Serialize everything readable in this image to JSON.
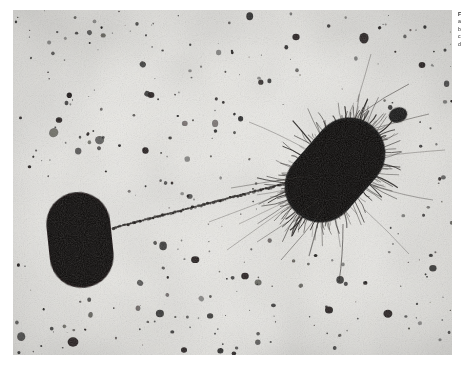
{
  "figure": {
    "kind": "electron-micrograph",
    "plate": {
      "background_color": "#e9e8e4",
      "stain": "negative stain",
      "border_color": "#ffffff"
    },
    "margin_caption": {
      "visible_fragment": "clipped at page edge",
      "lines": [
        "F",
        "a",
        "b",
        "c",
        "d"
      ]
    },
    "structures": [
      {
        "id": "recipient-cell",
        "label": "smooth rod-shaped cell",
        "shape": "capsule",
        "fill": "#120f0e",
        "cx": 67,
        "cy": 230,
        "rx": 32,
        "ry": 48,
        "rotation": -6
      },
      {
        "id": "donor-cell",
        "label": "fimbriated cell bearing numerous pili",
        "shape": "capsule",
        "fill": "#100d0c",
        "cx": 322,
        "cy": 160,
        "rx": 36,
        "ry": 58,
        "rotation": 41,
        "fimbriae_count": 150
      },
      {
        "id": "f-pilus",
        "label": "conjugative F pilus labelled with particles",
        "shape": "beaded-filament",
        "x1": 100,
        "y1": 218,
        "x2": 295,
        "y2": 168,
        "bead_count": 78
      },
      {
        "id": "polar-blob",
        "label": "dense particle at cell pole",
        "shape": "ellipse",
        "cx": 385,
        "cy": 105,
        "rx": 9,
        "ry": 7,
        "fill": "#171413"
      },
      {
        "id": "background-particles",
        "label": "scattered stain debris and latex marker spheres",
        "count": 340,
        "fill": "#1b1918"
      }
    ]
  }
}
